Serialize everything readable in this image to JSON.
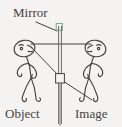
{
  "diagram": {
    "title_label": "Mirror",
    "object_label": "Object",
    "image_label": "Image",
    "background_color": "#f4f3f1",
    "ink_color": "#45413f",
    "mirror_accent_color": "#7fae86",
    "mirror": {
      "orientation": "vertical",
      "x_position_px": 60,
      "top_px": 22,
      "bottom_px": 124,
      "surface_lines": 2,
      "top_bracket_color": "#7fae86",
      "pivot_box_present": true,
      "pivot_box_y_px": 78
    },
    "figures": [
      {
        "name": "object",
        "side": "left",
        "facing": "right",
        "head_center_px": [
          25,
          48
        ],
        "label": "Object"
      },
      {
        "name": "image",
        "side": "right",
        "facing": "left",
        "head_center_px": [
          96,
          48
        ],
        "label": "Image"
      }
    ],
    "rays": [
      {
        "name": "normal-ray",
        "kind": "horizontal",
        "from_px": [
          30,
          44
        ],
        "to_px": [
          92,
          44
        ]
      },
      {
        "name": "incident-ray",
        "kind": "diagonal",
        "from_px": [
          30,
          46
        ],
        "to_px": [
          60,
          78
        ]
      },
      {
        "name": "reflected-ray-extension",
        "kind": "diagonal",
        "from_px": [
          60,
          78
        ],
        "to_px": [
          92,
          99
        ]
      },
      {
        "name": "mirror-leader-line",
        "kind": "diagonal",
        "from_px": [
          36,
          22
        ],
        "to_px": [
          57,
          30
        ]
      }
    ]
  }
}
